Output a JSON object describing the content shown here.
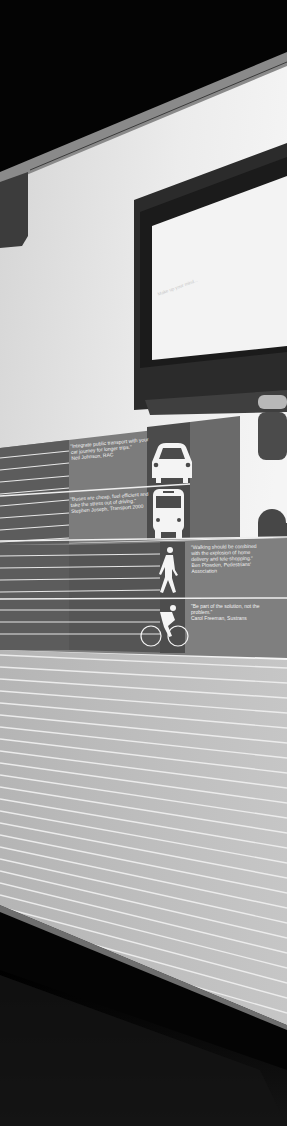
{
  "photo": {
    "subject": "Exhibition wall panel with monitor and transport icons",
    "colors": {
      "ceiling": "#050505",
      "wall": "#e4e4e4",
      "panel_mid": "#7e7e7e",
      "panel_dark": "#4a4a4a",
      "stripe_panel": "#bdbdbd",
      "floor": "#0e0e0e",
      "frame": "#2a2a2a"
    }
  },
  "monitor": {
    "screen_text": "Make up your mind..."
  },
  "panels": [
    {
      "icon": "car-icon",
      "quote": "\"Integrate public transport with your\ncar journey for longer trips.\"\nNeil Johnson, RAC"
    },
    {
      "icon": "bus-icon",
      "quote": "\"Buses are cheap, fuel efficient and\ntake the stress out of driving.\"\nStephen Joseph, Transport 2000"
    },
    {
      "icon": "pedestrian-icon",
      "quote": "\"Walking should be combined\nwith the explosion of home\ndelivery and tele-shopping.\"\nBen Plowden, Pedestrians'\nAssociation"
    },
    {
      "icon": "cyclist-icon",
      "quote": "\"Be part of the solution, not the\nproblem.\"\nCarol Freeman, Sustrans"
    }
  ]
}
